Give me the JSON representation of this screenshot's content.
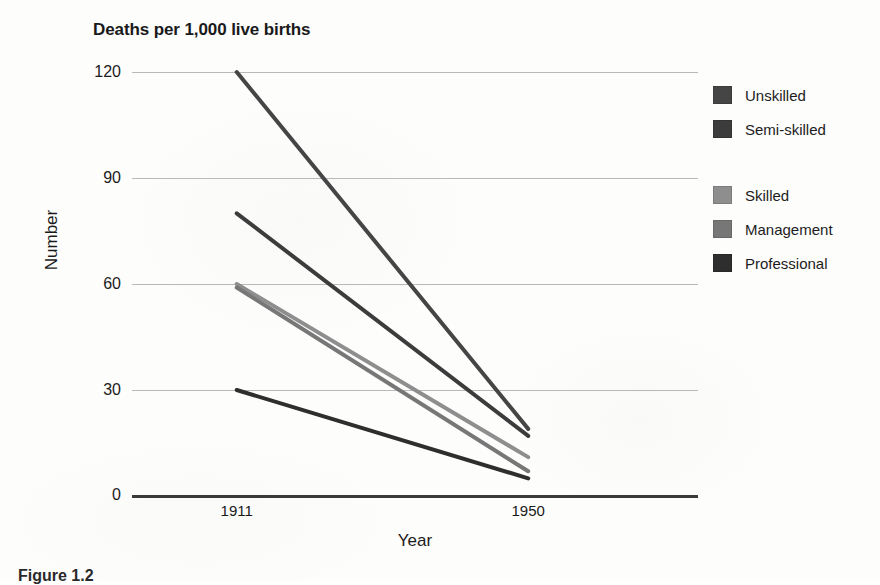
{
  "figure": {
    "caption": "Figure 1.2"
  },
  "chart_data": {
    "type": "line",
    "title": "Deaths per 1,000 live births",
    "xlabel": "Year",
    "ylabel": "Number",
    "x": [
      1911,
      1950
    ],
    "xtick_labels": [
      "1911",
      "1950"
    ],
    "ylim": [
      0,
      120
    ],
    "yticks": [
      0,
      30,
      60,
      90,
      120
    ],
    "ytick_labels": [
      "0",
      "30",
      "60",
      "90",
      "120"
    ],
    "grid": true,
    "legend_position": "right",
    "series": [
      {
        "name": "Unskilled",
        "values": [
          120,
          19
        ],
        "color": "#454545"
      },
      {
        "name": "Semi-skilled",
        "values": [
          80,
          17
        ],
        "color": "#3c3c3c"
      },
      {
        "name": "Skilled",
        "values": [
          60,
          11
        ],
        "color": "#8e8e8e"
      },
      {
        "name": "Management",
        "values": [
          59,
          7
        ],
        "color": "#777777"
      },
      {
        "name": "Professional",
        "values": [
          30,
          5
        ],
        "color": "#2e2e2e"
      }
    ]
  }
}
